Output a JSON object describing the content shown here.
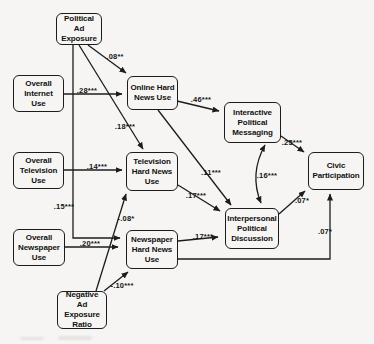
{
  "figure": {
    "kind": "structural-path-model-diagram",
    "colors": {
      "background": "#f6f5f3",
      "line": "#1c1c1c",
      "box_border": "#1c1c1c",
      "text": "#111111"
    }
  },
  "nodes": {
    "political_ad_exposure": {
      "label": "Political Ad Exposure"
    },
    "overall_internet_use": {
      "label": "Overall Internet Use"
    },
    "online_hard_news_use": {
      "label": "Online Hard News Use"
    },
    "overall_television_use": {
      "label": "Overall Television Use"
    },
    "television_hard_news_use": {
      "label": "Television Hard News Use"
    },
    "overall_newspaper_use": {
      "label": "Overall Newspaper Use"
    },
    "newspaper_hard_news_use": {
      "label": "Newspaper Hard News Use"
    },
    "negative_ad_exposure_ratio": {
      "label": "Negative Ad Exposure Ratio"
    },
    "interactive_political_messaging": {
      "label": "Interactive Political Messaging"
    },
    "interpersonal_political_discussion": {
      "label": "Interpersonal Political Discussion"
    },
    "civic_participation": {
      "label": "Civic Participation"
    }
  },
  "edges": [
    {
      "from": "political_ad_exposure",
      "to": "online_hard_news_use",
      "label": ".08**",
      "bidirectional": false
    },
    {
      "from": "overall_internet_use",
      "to": "online_hard_news_use",
      "label": ".28***",
      "bidirectional": false
    },
    {
      "from": "political_ad_exposure",
      "to": "television_hard_news_use",
      "label": ".18***",
      "bidirectional": false
    },
    {
      "from": "overall_television_use",
      "to": "television_hard_news_use",
      "label": ".14***",
      "bidirectional": false
    },
    {
      "from": "political_ad_exposure",
      "to": "newspaper_hard_news_use",
      "label": ".15***",
      "bidirectional": false
    },
    {
      "from": "overall_newspaper_use",
      "to": "newspaper_hard_news_use",
      "label": ".20***",
      "bidirectional": false
    },
    {
      "from": "negative_ad_exposure_ratio",
      "to": "television_hard_news_use",
      "label": "-.08*",
      "bidirectional": false
    },
    {
      "from": "negative_ad_exposure_ratio",
      "to": "newspaper_hard_news_use",
      "label": "-.10***",
      "bidirectional": false
    },
    {
      "from": "online_hard_news_use",
      "to": "interactive_political_messaging",
      "label": ".46***",
      "bidirectional": false
    },
    {
      "from": "online_hard_news_use",
      "to": "interpersonal_political_discussion",
      "label": ".11***",
      "bidirectional": false
    },
    {
      "from": "television_hard_news_use",
      "to": "interpersonal_political_discussion",
      "label": ".17***",
      "bidirectional": false
    },
    {
      "from": "newspaper_hard_news_use",
      "to": "interpersonal_political_discussion",
      "label": ".17***",
      "bidirectional": false
    },
    {
      "from": "interactive_political_messaging",
      "to": "interpersonal_political_discussion",
      "label": ".16***",
      "bidirectional": true
    },
    {
      "from": "interactive_political_messaging",
      "to": "civic_participation",
      "label": ".25***",
      "bidirectional": false
    },
    {
      "from": "interpersonal_political_discussion",
      "to": "civic_participation",
      "label": ".07*",
      "bidirectional": false
    },
    {
      "from": "newspaper_hard_news_use",
      "to": "civic_participation",
      "label": ".07*",
      "bidirectional": false
    }
  ]
}
